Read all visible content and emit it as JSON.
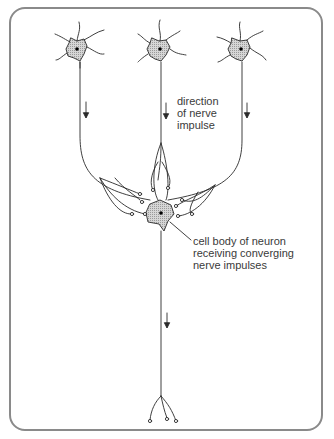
{
  "diagram": {
    "title": "Converging nerve impulses",
    "labels": {
      "direction": "direction\nof nerve\nimpulse",
      "cell_body": "cell body of neuron\nreceiving converging\nnerve impulses"
    },
    "colors": {
      "frame": "#8a8a8a",
      "stroke": "#2a2a2a",
      "cell_fill": "#c8c8c8",
      "text": "#3a3a3a"
    },
    "components": [
      {
        "name": "presynaptic-neuron-left"
      },
      {
        "name": "presynaptic-neuron-middle"
      },
      {
        "name": "presynaptic-neuron-right"
      },
      {
        "name": "receiving-neuron"
      }
    ]
  }
}
